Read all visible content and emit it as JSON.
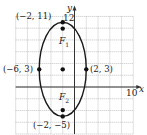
{
  "chart_data": {
    "type": "scatter",
    "title": "",
    "xlabel": "x",
    "ylabel": "y",
    "xlim": [
      -10,
      10
    ],
    "ylim": [
      -8,
      12
    ],
    "grid": true,
    "grid_step": 2,
    "legend": "none",
    "tick_labels": {
      "x": [
        "10"
      ],
      "y": [
        "12"
      ]
    },
    "curve": {
      "kind": "ellipse",
      "center": [
        -2,
        3
      ],
      "semi_major_vertical": 8,
      "semi_minor_horizontal": 4
    },
    "points": [
      {
        "x": -2,
        "y": 11,
        "label": "(−2, 11)"
      },
      {
        "x": -6,
        "y": 3,
        "label": "(−6, 3)"
      },
      {
        "x": -2,
        "y": 3,
        "label": ""
      },
      {
        "x": 2,
        "y": 3,
        "label": "(2, 3)"
      },
      {
        "x": -2,
        "y": -5,
        "label": "(−2, −5)"
      },
      {
        "x": -2,
        "y": 9.93,
        "label": "F1"
      },
      {
        "x": -2,
        "y": -3.93,
        "label": "F2"
      }
    ],
    "annotations": [
      {
        "text": "F",
        "subscript": "1",
        "at": [
          -2,
          9.93
        ]
      },
      {
        "text": "F",
        "subscript": "2",
        "at": [
          -2,
          -3.93
        ]
      }
    ]
  },
  "labels": {
    "top_vertex": "(−2, 11)",
    "left_vertex": "(−6, 3)",
    "right_vertex": "(2, 3)",
    "bottom_vertex": "(−2, −5)",
    "focus1_letter": "F",
    "focus1_sub": "1",
    "focus2_letter": "F",
    "focus2_sub": "2",
    "x_axis": "x",
    "y_axis": "y",
    "x_tick": "10",
    "y_tick": "12"
  }
}
